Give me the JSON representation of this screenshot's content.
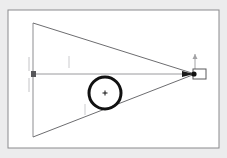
{
  "figure": {
    "name": "optical-convergence-ray-diagram",
    "canvas": {
      "width": 227,
      "height": 158
    },
    "background_color": "#ececed",
    "panel": {
      "name": "drawing-panel",
      "x": 8,
      "y": 10,
      "width": 211,
      "height": 138,
      "fill": "#ffffff",
      "border_color": "#8a8a8d",
      "border_width": 1
    },
    "elements": {
      "cone": {
        "label": "converging-ray-cone",
        "stroke": "#6d6d70",
        "stroke_width": 1,
        "fill": "none",
        "apex_x": 195,
        "apex_y": 74,
        "base_x": 33,
        "base_top_y": 23,
        "base_bottom_y": 137
      },
      "base_edge": {
        "label": "cone-base-vertical-edge",
        "stroke": "#8d8d90",
        "stroke_width": 1,
        "x": 33,
        "y1": 23,
        "y2": 137
      },
      "optical_axis": {
        "label": "optical-axis",
        "stroke": "#9a9a9d",
        "stroke_width": 1,
        "x1": 33,
        "x2": 196,
        "y": 74
      },
      "axis_arrowhead": {
        "label": "axis-direction-arrowhead",
        "fill": "#1a1a1a",
        "tip_x": 194,
        "tip_y": 74,
        "length": 12,
        "half_height": 3
      },
      "source_marker": {
        "label": "source-point-square-marker",
        "fill": "#58585b",
        "x": 31,
        "y": 71,
        "width": 5,
        "height": 6
      },
      "focus_box": {
        "label": "focal-plane-detector-box",
        "stroke": "#5a5a5d",
        "stroke_width": 1,
        "fill": "#ffffff",
        "x": 193,
        "y": 69,
        "width": 13,
        "height": 10
      },
      "focus_dot": {
        "label": "focus-point",
        "fill": "#111111",
        "cx": 194,
        "cy": 74,
        "r": 2.6
      },
      "vertical_arrow": {
        "label": "aperture-height-arrow",
        "stroke": "#a2a2a5",
        "stroke_width": 1,
        "x": 195,
        "y_top": 54,
        "y_bottom": 70,
        "arrow_half_width": 2.5,
        "arrow_length": 5
      },
      "lens_ring": {
        "label": "lens-aperture-ring",
        "stroke": "#111111",
        "stroke_width": 3,
        "fill": "none",
        "cx": 105,
        "cy": 93,
        "r": 16
      },
      "lens_center_cross": {
        "label": "lens-center-crosshair",
        "stroke": "#111111",
        "stroke_width": 1,
        "cx": 105,
        "cy": 93,
        "arm": 2.5
      },
      "tick_marks": [
        {
          "label": "tick-left-upper",
          "x": 29,
          "y1": 57,
          "y2": 71,
          "stroke": "#c4c4c7"
        },
        {
          "label": "tick-left-lower",
          "x": 29,
          "y1": 78,
          "y2": 92,
          "stroke": "#c4c4c7"
        },
        {
          "label": "tick-mid-upper",
          "x": 69,
          "y1": 56,
          "y2": 68,
          "stroke": "#cbcbce"
        },
        {
          "label": "tick-mid-lower",
          "x": 85,
          "y1": 104,
          "y2": 115,
          "stroke": "#cbcbce"
        }
      ]
    }
  }
}
